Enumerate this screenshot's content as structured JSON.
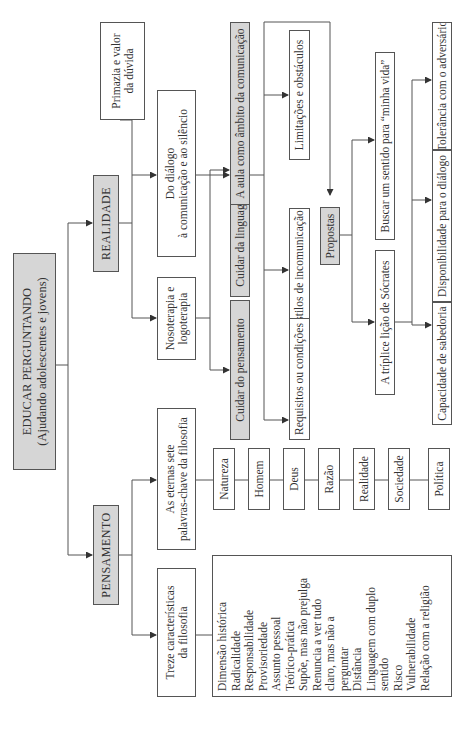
{
  "orientation": "rotated 90deg counter-clockwise",
  "root": {
    "title": "EDUCAR PERGUNTANDO",
    "subtitle": "(Ajudando adolescentes e jovens)"
  },
  "branches": {
    "realidade": {
      "label": "REALIDADE",
      "primazia": {
        "line1": "Primazia e valor",
        "line2": "da dúvida"
      },
      "dialogo": {
        "line1": "Do diálogo",
        "line2": "à comunicação e ao silêncio"
      },
      "nosoterapia": {
        "line1": "Nosoterapia e",
        "line2": "logoterapia"
      },
      "cuidar_pensamento": "Cuidar do pensamento",
      "cuidar_linguagem": "Cuidar da linguagem",
      "aula": "A aula como âmbito da comunicação",
      "limitacoes": "Limitações e obstáculos",
      "estilos": "Estilos de incomunicação",
      "requisitos": "Requisitos ou condições",
      "propostas": "Propostas",
      "buscar": "Buscar um sentido para “minha vida”",
      "triplice": "A tríplice lição de Sócrates",
      "tolerancia": "Tolerância com o adversário",
      "disponibilidade": "Disponibilidade para o diálogo",
      "capacidade": "Capacidade de sabedoria"
    },
    "pensamento": {
      "label": "PENSAMENTO",
      "sete": {
        "line1": "As eternas sete",
        "line2": "palavras-chave da filosofia"
      },
      "keywords": [
        "Natureza",
        "Homem",
        "Deus",
        "Razão",
        "Realidade",
        "Sociedade",
        "Política"
      ],
      "treze": {
        "line1": "Treze características",
        "line2": "da filosofia"
      },
      "caracteristicas": [
        "Dimensão histórica",
        "Radicalidade",
        "Responsabilidade",
        "Provisoriedade",
        "Assunto pessoal",
        "Teórico-prática",
        "Supõe, mas não prejulga",
        "Renuncia a ver tudo",
        "claro, mas não a",
        "perguntar",
        "Distância",
        "Linguagem com duplo",
        "sentido",
        "Risco",
        "Vulnerabilidade",
        "Relação com a religião"
      ]
    }
  },
  "colors": {
    "gray_box": "#d6d6d6",
    "line": "#555555",
    "text": "#333333"
  }
}
